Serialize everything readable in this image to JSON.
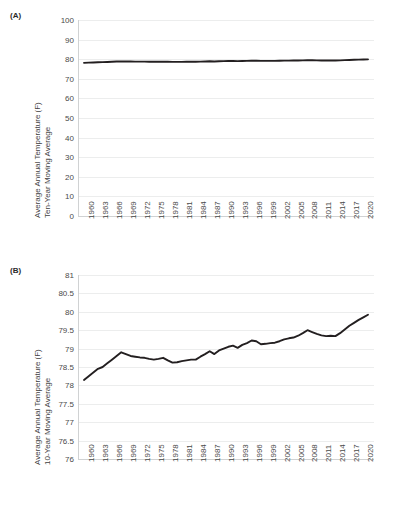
{
  "figure": {
    "panels": [
      {
        "tag": "(A)",
        "ytitle_line1": "Average Annual Temperature (F)",
        "ytitle_line2": "Ten-Year Moving Average",
        "yticks": [
          "100",
          "90",
          "80",
          "70",
          "60",
          "50",
          "40",
          "30",
          "20",
          "10",
          "0"
        ],
        "xticks": [
          "1960",
          "1963",
          "1966",
          "1969",
          "1972",
          "1975",
          "1978",
          "1981",
          "1984",
          "1987",
          "1990",
          "1993",
          "1996",
          "1999",
          "2002",
          "2005",
          "2008",
          "2011",
          "2014",
          "2017",
          "2020"
        ]
      },
      {
        "tag": "(B)",
        "ytitle_line1": "Average Annual Temperature (F)",
        "ytitle_line2": "10-Year Moving Average",
        "yticks": [
          "81",
          "80.5",
          "80",
          "79.5",
          "79",
          "78.5",
          "78",
          "77.5",
          "77",
          "76.5",
          "76"
        ],
        "xticks": [
          "1960",
          "1963",
          "1966",
          "1969",
          "1972",
          "1975",
          "1978",
          "1981",
          "1984",
          "1987",
          "1990",
          "1993",
          "1996",
          "1999",
          "2002",
          "2005",
          "2008",
          "2011",
          "2014",
          "2017",
          "2020"
        ]
      }
    ]
  },
  "chart_data": [
    {
      "type": "line",
      "panel": "(A)",
      "title": "",
      "xlabel": "",
      "ylabel": "Average Annual Temperature (F) Ten-Year Moving Average",
      "ylim": [
        0,
        100
      ],
      "ytick_step": 10,
      "xlim": [
        1960,
        2021
      ],
      "grid": true,
      "legend": "none",
      "line_color": "#231f20",
      "x": [
        1960,
        1961,
        1962,
        1963,
        1964,
        1965,
        1966,
        1967,
        1968,
        1969,
        1970,
        1971,
        1972,
        1973,
        1974,
        1975,
        1976,
        1977,
        1978,
        1979,
        1980,
        1981,
        1982,
        1983,
        1984,
        1985,
        1986,
        1987,
        1988,
        1989,
        1990,
        1991,
        1992,
        1993,
        1994,
        1995,
        1996,
        1997,
        1998,
        1999,
        2000,
        2001,
        2002,
        2003,
        2004,
        2005,
        2006,
        2007,
        2008,
        2009,
        2010,
        2011,
        2012,
        2013,
        2014,
        2015,
        2016,
        2017,
        2018,
        2019,
        2020,
        2021
      ],
      "values": [
        78.15,
        78.25,
        78.35,
        78.45,
        78.5,
        78.6,
        78.7,
        78.8,
        78.9,
        78.85,
        78.8,
        78.78,
        78.76,
        78.75,
        78.72,
        78.7,
        78.72,
        78.75,
        78.68,
        78.62,
        78.63,
        78.66,
        78.68,
        78.7,
        78.7,
        78.78,
        78.85,
        78.93,
        78.85,
        78.95,
        79.0,
        79.05,
        79.08,
        79.02,
        79.1,
        79.15,
        79.22,
        79.2,
        79.12,
        79.13,
        79.15,
        79.16,
        79.2,
        79.25,
        79.28,
        79.3,
        79.35,
        79.42,
        79.5,
        79.45,
        79.4,
        79.36,
        79.34,
        79.35,
        79.34,
        79.42,
        79.52,
        79.62,
        79.7,
        79.78,
        79.85,
        79.92
      ]
    },
    {
      "type": "line",
      "panel": "(B)",
      "title": "",
      "xlabel": "",
      "ylabel": "Average Annual Temperature (F) 10-Year Moving Average",
      "ylim": [
        76,
        81
      ],
      "ytick_step": 0.5,
      "xlim": [
        1960,
        2021
      ],
      "grid": true,
      "legend": "none",
      "line_color": "#231f20",
      "x": [
        1960,
        1961,
        1962,
        1963,
        1964,
        1965,
        1966,
        1967,
        1968,
        1969,
        1970,
        1971,
        1972,
        1973,
        1974,
        1975,
        1976,
        1977,
        1978,
        1979,
        1980,
        1981,
        1982,
        1983,
        1984,
        1985,
        1986,
        1987,
        1988,
        1989,
        1990,
        1991,
        1992,
        1993,
        1994,
        1995,
        1996,
        1997,
        1998,
        1999,
        2000,
        2001,
        2002,
        2003,
        2004,
        2005,
        2006,
        2007,
        2008,
        2009,
        2010,
        2011,
        2012,
        2013,
        2014,
        2015,
        2016,
        2017,
        2018,
        2019,
        2020,
        2021
      ],
      "values": [
        78.15,
        78.25,
        78.35,
        78.45,
        78.5,
        78.6,
        78.7,
        78.8,
        78.9,
        78.85,
        78.8,
        78.78,
        78.76,
        78.75,
        78.72,
        78.7,
        78.72,
        78.75,
        78.68,
        78.62,
        78.63,
        78.66,
        78.68,
        78.7,
        78.7,
        78.78,
        78.85,
        78.93,
        78.85,
        78.95,
        79.0,
        79.05,
        79.08,
        79.02,
        79.1,
        79.15,
        79.22,
        79.2,
        79.12,
        79.13,
        79.15,
        79.16,
        79.2,
        79.25,
        79.28,
        79.3,
        79.35,
        79.42,
        79.5,
        79.45,
        79.4,
        79.36,
        79.34,
        79.35,
        79.34,
        79.42,
        79.52,
        79.62,
        79.7,
        79.78,
        79.85,
        79.92
      ]
    }
  ]
}
